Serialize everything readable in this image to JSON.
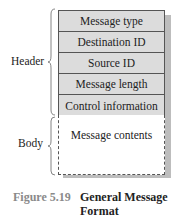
{
  "diagram": {
    "header_label": "Header",
    "body_label": "Body",
    "header_fields": [
      "Message type",
      "Destination ID",
      "Source ID",
      "Message length",
      "Control information"
    ],
    "body_field": "Message contents",
    "colors": {
      "field_fill": "#dcdcdc",
      "border": "#555555",
      "shadow": "#bdbdbd"
    }
  },
  "caption": {
    "number": "Figure 5.19",
    "title_line1": "General Message",
    "title_line2": "Format"
  }
}
